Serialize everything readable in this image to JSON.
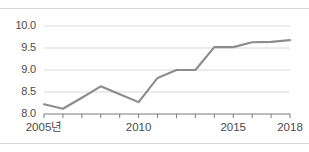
{
  "figure": {
    "background_color": "#ffffff",
    "top_rule_color": "#d8d8d8",
    "bottom_rule_color": "#d8d8d8"
  },
  "style": {
    "line_color": "#8c8c8c",
    "grid_color": "#d9d9d9",
    "axis_color": "#7a7a7a",
    "tick_color": "#7a7a7a",
    "text_color": "#4a4a4a"
  },
  "chart_data": {
    "type": "line",
    "title": "",
    "subtitle": "",
    "xlabel": "",
    "ylabel": "",
    "x": [
      2005,
      2006,
      2007,
      2008,
      2009,
      2010,
      2011,
      2012,
      2013,
      2014,
      2015,
      2016,
      2017,
      2018
    ],
    "categories": [
      "2005",
      "2006",
      "2007",
      "2008",
      "2009",
      "2010",
      "2011",
      "2012",
      "2013",
      "2014",
      "2015",
      "2016",
      "2017",
      "2018"
    ],
    "values": [
      8.22,
      8.12,
      8.37,
      8.63,
      8.45,
      8.27,
      8.82,
      9.0,
      9.0,
      9.52,
      9.52,
      9.63,
      9.64,
      9.68
    ],
    "series": [
      {
        "name": "series-1",
        "values": [
          8.22,
          8.12,
          8.37,
          8.63,
          8.45,
          8.27,
          8.82,
          9.0,
          9.0,
          9.52,
          9.52,
          9.63,
          9.64,
          9.68
        ]
      }
    ],
    "xlim": [
      2005,
      2018
    ],
    "ylim": [
      8.0,
      10.0
    ],
    "ytick_values": [
      8.0,
      8.5,
      9.0,
      9.5,
      10.0
    ],
    "ytick_labels": [
      "8.0",
      "8.5",
      "9.0",
      "9.5",
      "10.0"
    ],
    "xtick_values": [
      2005,
      2010,
      2015,
      2018
    ],
    "xtick_labels": [
      "2005년",
      "2010",
      "2015",
      "2018"
    ],
    "minor_xticks": [
      2005,
      2006,
      2007,
      2008,
      2009,
      2010,
      2011,
      2012,
      2013,
      2014,
      2015,
      2016,
      2017,
      2018
    ],
    "grid": "horizontal",
    "legend": "none",
    "legend_entries": [],
    "annotations": []
  }
}
